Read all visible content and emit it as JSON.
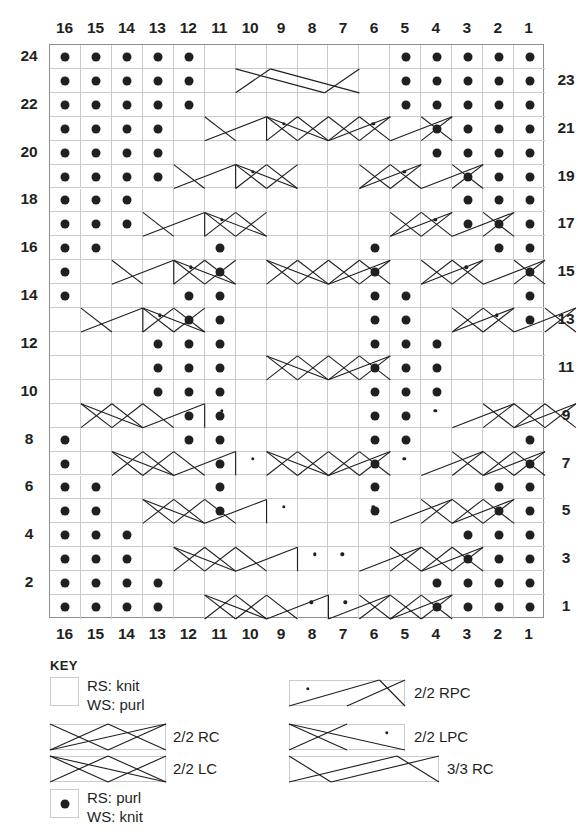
{
  "chart": {
    "stitch_count": 16,
    "row_count": 24,
    "column_labels_top": [
      "16",
      "15",
      "14",
      "13",
      "12",
      "11",
      "10",
      "9",
      "8",
      "7",
      "6",
      "5",
      "4",
      "3",
      "2",
      "1"
    ],
    "column_labels_bottom": [
      "16",
      "15",
      "14",
      "13",
      "12",
      "11",
      "10",
      "9",
      "8",
      "7",
      "6",
      "5",
      "4",
      "3",
      "2",
      "1"
    ],
    "row_labels_left": [
      "24",
      "22",
      "20",
      "18",
      "16",
      "14",
      "12",
      "10",
      "8",
      "6",
      "4",
      "2"
    ],
    "row_labels_right": [
      "23",
      "21",
      "19",
      "17",
      "15",
      "13",
      "11",
      "9",
      "7",
      "5",
      "3",
      "1"
    ],
    "grid_line_color": "#c9cbcd",
    "border_color": "#8c8f92",
    "symbol_color": "#231f20",
    "purl_dots": {
      "24": [
        16,
        15,
        14,
        13,
        12,
        5,
        4,
        3,
        2,
        1
      ],
      "23": [
        16,
        15,
        14,
        13,
        12,
        5,
        4,
        3,
        2,
        1
      ],
      "22": [
        16,
        15,
        14,
        13,
        12,
        5,
        4,
        3,
        2,
        1
      ],
      "21": [
        16,
        15,
        14,
        13,
        4,
        3,
        2,
        1
      ],
      "20": [
        16,
        15,
        14,
        13,
        4,
        3,
        2,
        1
      ],
      "19": [
        16,
        15,
        14,
        13,
        3,
        2,
        1
      ],
      "18": [
        16,
        15,
        14,
        3,
        2,
        1
      ],
      "17": [
        16,
        15,
        14,
        3,
        2,
        1
      ],
      "16": [
        16,
        15,
        11,
        6,
        2,
        1
      ],
      "15": [
        16,
        11,
        6,
        1
      ],
      "14": [
        16,
        12,
        11,
        6,
        5,
        1
      ],
      "13": [
        12,
        11,
        6,
        5,
        1
      ],
      "12": [
        13,
        12,
        11,
        6,
        5,
        4
      ],
      "11": [
        13,
        12,
        11,
        6,
        5,
        4
      ],
      "10": [
        13,
        12,
        11,
        6,
        5,
        4
      ],
      "9": [
        12,
        11,
        6,
        5
      ],
      "8": [
        16,
        12,
        11,
        6,
        5,
        1
      ],
      "7": [
        16,
        11,
        6,
        1
      ],
      "6": [
        16,
        15,
        11,
        6,
        2,
        1
      ],
      "5": [
        16,
        15,
        11,
        6,
        2,
        1
      ],
      "4": [
        16,
        15,
        14,
        3,
        2,
        1
      ],
      "3": [
        16,
        15,
        14,
        3,
        2,
        1
      ],
      "2": [
        16,
        15,
        14,
        13,
        4,
        3,
        2,
        1
      ],
      "1": [
        16,
        15,
        14,
        13,
        4,
        3,
        2,
        1
      ]
    },
    "cables": [
      {
        "row": 23,
        "type": "3/3 RC",
        "right": 11,
        "left": 6
      },
      {
        "row": 21,
        "type": "2/2 RPC",
        "right": 12,
        "left": 11
      },
      {
        "row": 21,
        "type": "2/2 RC",
        "right": 10,
        "left": 9
      },
      {
        "row": 21,
        "type": "2/2 LC",
        "right": 8,
        "left": 7
      },
      {
        "row": 21,
        "type": "2/2 LPC",
        "right": 6,
        "left": 5
      },
      {
        "row": 19,
        "type": "2/2 RPC",
        "right": 13,
        "left": 12
      },
      {
        "row": 19,
        "type": "2/2 RC",
        "right": 11,
        "left": 10
      },
      {
        "row": 19,
        "type": "2/2 LC",
        "right": 7,
        "left": 6
      },
      {
        "row": 19,
        "type": "2/2 LPC",
        "right": 5,
        "left": 4
      },
      {
        "row": 17,
        "type": "2/2 RPC",
        "right": 14,
        "left": 13
      },
      {
        "row": 17,
        "type": "2/2 RC",
        "right": 12,
        "left": 11
      },
      {
        "row": 17,
        "type": "2/2 LC",
        "right": 6,
        "left": 5
      },
      {
        "row": 17,
        "type": "2/2 LPC",
        "right": 4,
        "left": 3
      },
      {
        "row": 15,
        "type": "2/2 RPC",
        "right": 15,
        "left": 14
      },
      {
        "row": 15,
        "type": "2/2 RC",
        "right": 13,
        "left": 12
      },
      {
        "row": 15,
        "type": "2/2 RC",
        "right": 10,
        "left": 9
      },
      {
        "row": 15,
        "type": "2/2 LC",
        "right": 8,
        "left": 7
      },
      {
        "row": 15,
        "type": "2/2 LC",
        "right": 5,
        "left": 4
      },
      {
        "row": 15,
        "type": "2/2 LPC",
        "right": 3,
        "left": 2
      },
      {
        "row": 13,
        "type": "2/2 RPC",
        "right": 16,
        "left": 15
      },
      {
        "row": 13,
        "type": "2/2 RC",
        "right": 14,
        "left": 13
      },
      {
        "row": 13,
        "type": "2/2 LC",
        "right": 4,
        "left": 3
      },
      {
        "row": 13,
        "type": "2/2 LPC",
        "right": 2,
        "left": 1
      },
      {
        "row": 11,
        "type": "2/2 RC",
        "right": 10,
        "left": 9
      },
      {
        "row": 11,
        "type": "2/2 LC",
        "right": 8,
        "left": 7
      },
      {
        "row": 9,
        "type": "2/2 RC",
        "right": 16,
        "left": 15
      },
      {
        "row": 9,
        "type": "2/2 RPC",
        "right": 14,
        "left": 13
      },
      {
        "row": 9,
        "type": "2/2 LPC",
        "right": 4,
        "left": 3
      },
      {
        "row": 9,
        "type": "2/2 LC",
        "right": 2,
        "left": 1
      },
      {
        "row": 7,
        "type": "2/2 RC",
        "right": 15,
        "left": 14
      },
      {
        "row": 7,
        "type": "2/2 RPC",
        "right": 13,
        "left": 12
      },
      {
        "row": 7,
        "type": "2/2 RC",
        "right": 10,
        "left": 9
      },
      {
        "row": 7,
        "type": "2/2 LC",
        "right": 8,
        "left": 7
      },
      {
        "row": 7,
        "type": "2/2 LPC",
        "right": 5,
        "left": 4
      },
      {
        "row": 7,
        "type": "2/2 LC",
        "right": 3,
        "left": 2
      },
      {
        "row": 5,
        "type": "2/2 RC",
        "right": 14,
        "left": 13
      },
      {
        "row": 5,
        "type": "2/2 RPC",
        "right": 12,
        "left": 11
      },
      {
        "row": 5,
        "type": "2/2 LPC",
        "right": 6,
        "left": 5
      },
      {
        "row": 5,
        "type": "2/2 LC",
        "right": 4,
        "left": 3
      },
      {
        "row": 3,
        "type": "2/2 RC",
        "right": 13,
        "left": 12
      },
      {
        "row": 3,
        "type": "2/2 RPC",
        "right": 11,
        "left": 10
      },
      {
        "row": 3,
        "type": "2/2 LPC",
        "right": 7,
        "left": 6
      },
      {
        "row": 3,
        "type": "2/2 LC",
        "right": 5,
        "left": 4
      },
      {
        "row": 1,
        "type": "2/2 RC",
        "right": 12,
        "left": 11
      },
      {
        "row": 1,
        "type": "2/2 RPC",
        "right": 10,
        "left": 9
      },
      {
        "row": 1,
        "type": "2/2 LPC",
        "right": 8,
        "left": 7
      },
      {
        "row": 1,
        "type": "2/2 LC",
        "right": 6,
        "left": 5
      }
    ]
  },
  "key": {
    "title": "KEY",
    "entries": [
      {
        "id": "rs-knit",
        "symbol": "empty-box",
        "line1": "RS: knit",
        "line2": "WS: purl"
      },
      {
        "id": "rs-purl",
        "symbol": "dot-box",
        "line1": "RS: purl",
        "line2": "WS: knit"
      },
      {
        "id": "rc22",
        "symbol": "cable-2-2-rc",
        "label": "2/2 RC"
      },
      {
        "id": "lc22",
        "symbol": "cable-2-2-lc",
        "label": "2/2 LC"
      },
      {
        "id": "rpc22",
        "symbol": "cable-2-2-rpc",
        "label": "2/2 RPC"
      },
      {
        "id": "lpc22",
        "symbol": "cable-2-2-lpc",
        "label": "2/2 LPC"
      },
      {
        "id": "rc33",
        "symbol": "cable-3-3-rc",
        "label": "3/3 RC"
      }
    ]
  }
}
